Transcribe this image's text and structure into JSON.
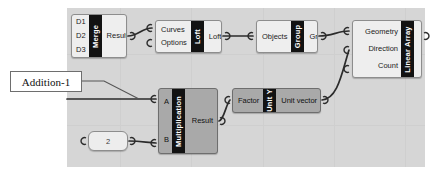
{
  "canvas": {
    "background_color": "#d6d6d6",
    "grid_color": "#cfcfcf"
  },
  "annotation": {
    "label": "Addition-1"
  },
  "nodes": [
    {
      "id": "merge",
      "title": "Merge",
      "selected": false,
      "inputs": [
        "D1",
        "D2",
        "D3"
      ],
      "outputs": [
        "Result"
      ]
    },
    {
      "id": "loft",
      "title": "Loft",
      "selected": false,
      "inputs": [
        "Curves",
        "Options"
      ],
      "outputs": [
        "Loft"
      ],
      "output_badge_icon": "sun-burst-icon",
      "output_badge_glyph": "✳"
    },
    {
      "id": "group",
      "title": "Group",
      "selected": false,
      "inputs": [
        "Objects"
      ],
      "outputs": [
        "Group"
      ]
    },
    {
      "id": "linear-array",
      "title": "Linear Array",
      "selected": false,
      "inputs": [
        "Geometry",
        "Direction",
        "Count"
      ],
      "outputs": []
    },
    {
      "id": "multiplication",
      "title": "Multiplication",
      "selected": true,
      "inputs": [
        "A",
        "B"
      ],
      "outputs": [
        "Result"
      ]
    },
    {
      "id": "unit-y",
      "title": "Unit Y",
      "selected": true,
      "inputs": [
        "Factor"
      ],
      "outputs": [
        "Unit vector"
      ]
    }
  ],
  "slider": {
    "value": "2"
  }
}
